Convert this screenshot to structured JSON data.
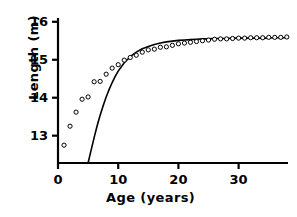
{
  "figure": {
    "title": "",
    "background_color": "#ffffff",
    "foreground_color": "#000000"
  },
  "labels": {
    "y_axis": "Length (m)",
    "x_axis": "Age (years)"
  },
  "chart_data": {
    "type": "scatter",
    "title": "",
    "xlabel": "Age (years)",
    "ylabel": "Length (m)",
    "xlim": [
      0,
      38.2
    ],
    "ylim": [
      12.28,
      16.1
    ],
    "xticks": [
      0,
      10,
      20,
      30
    ],
    "yticks": [
      13,
      14,
      15,
      16
    ],
    "xtick_labels": [
      "0",
      "10",
      "20",
      "30"
    ],
    "ytick_labels": [
      "13",
      "14",
      "15",
      "16"
    ],
    "grid": false,
    "legend": false,
    "marker": "open-circle",
    "series": [
      {
        "name": "observed-length-at-age",
        "style": "open-circle-markers",
        "marker_edge_color": "#000000",
        "marker_face_color": "#ffffff",
        "x": [
          1,
          2,
          3,
          4,
          5,
          6,
          7,
          8,
          9,
          10,
          11,
          12,
          13,
          14,
          15,
          16,
          17,
          18,
          19,
          20,
          21,
          22,
          23,
          24,
          25,
          26,
          27,
          28,
          29,
          30,
          31,
          32,
          33,
          34,
          35,
          36,
          37,
          38
        ],
        "y": [
          12.75,
          13.25,
          13.62,
          13.96,
          14.02,
          14.42,
          14.43,
          14.62,
          14.78,
          14.87,
          14.99,
          15.06,
          15.12,
          15.2,
          15.26,
          15.28,
          15.33,
          15.34,
          15.38,
          15.42,
          15.44,
          15.46,
          15.48,
          15.5,
          15.52,
          15.54,
          15.55,
          15.55,
          15.56,
          15.57,
          15.57,
          15.58,
          15.58,
          15.58,
          15.59,
          15.59,
          15.59,
          15.6
        ]
      },
      {
        "name": "fitted-growth-curve",
        "style": "solid-line",
        "line_color": "#000000",
        "line_width": 1.6,
        "x": [
          5,
          5.5,
          6,
          6.5,
          7,
          7.5,
          8,
          8.5,
          9,
          9.5,
          10,
          11,
          12,
          13,
          14,
          15,
          16,
          17,
          18,
          19,
          20,
          21,
          22,
          23,
          24,
          25,
          26,
          27,
          28,
          29,
          30,
          32,
          34,
          36,
          38
        ],
        "y": [
          12.28,
          12.62,
          12.95,
          13.26,
          13.54,
          13.79,
          14.02,
          14.22,
          14.4,
          14.56,
          14.7,
          14.92,
          15.08,
          15.2,
          15.29,
          15.35,
          15.4,
          15.44,
          15.47,
          15.49,
          15.51,
          15.52,
          15.53,
          15.54,
          15.55,
          15.55,
          15.56,
          15.56,
          15.56,
          15.57,
          15.57,
          15.57,
          15.57,
          15.58,
          15.58
        ]
      }
    ]
  }
}
